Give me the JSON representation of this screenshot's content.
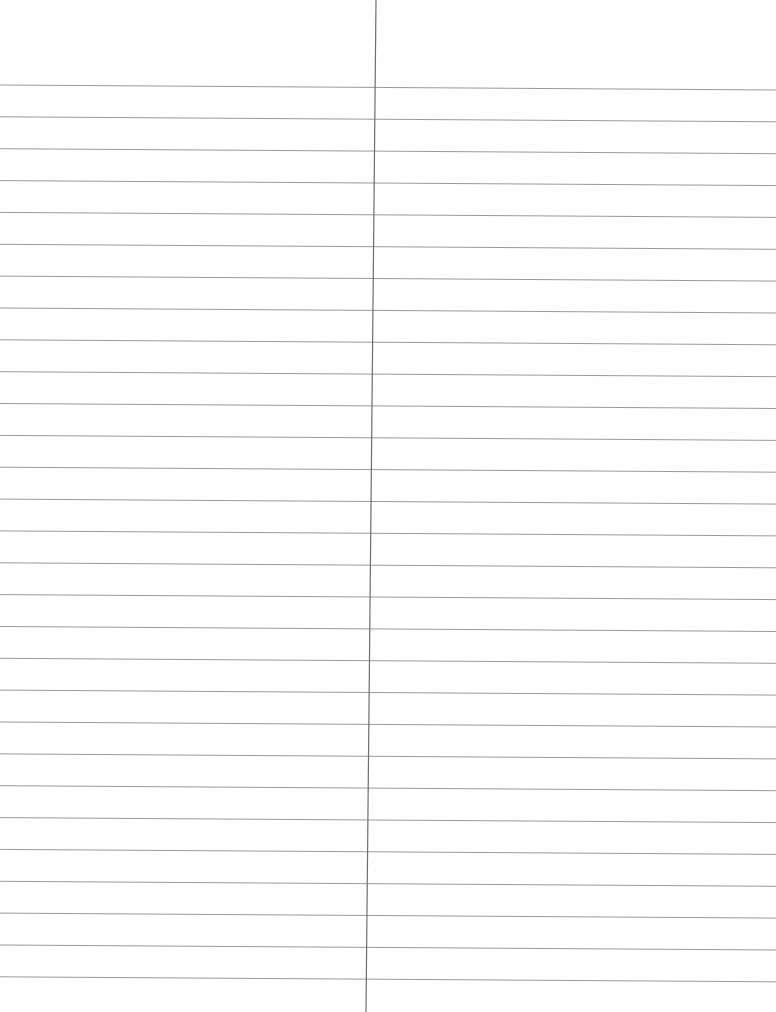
{
  "page": {
    "type": "ruled-sheet",
    "background_color": "#fefefe",
    "line_color": "#9a9a9a",
    "divider_color": "#6e6e6e",
    "rule_count": 29,
    "first_rule_y": 85,
    "rule_spacing": 31.85,
    "rule_skew_right": 5,
    "divider": {
      "x_top": 376,
      "x_bottom": 366,
      "y_start": 0,
      "y_end": 1012
    },
    "columns": [
      {
        "name": "left-column",
        "text": ""
      },
      {
        "name": "right-column",
        "text": ""
      }
    ]
  }
}
